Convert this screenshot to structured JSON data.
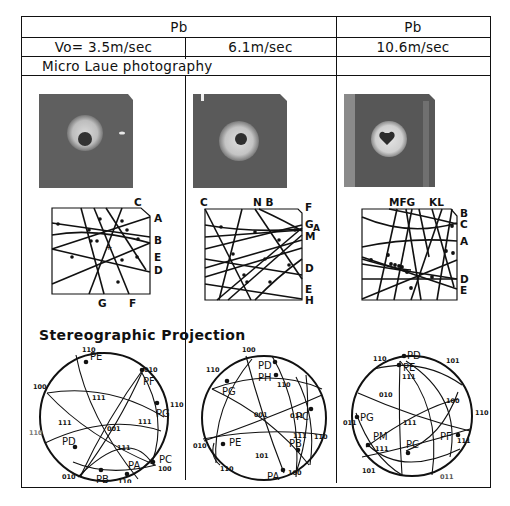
{
  "header": {
    "row1": {
      "left_group": "Pb",
      "right_group": "Pb"
    },
    "row2": {
      "col1": "Vo= 3.5m/sec",
      "col2": "6.1m/sec",
      "col3": "10.6m/sec"
    },
    "row3": {
      "label": "Micro Laue photography"
    }
  },
  "sections": {
    "stereo_title": "Stereographic Projection"
  },
  "laue_traces": [
    {
      "top_labels": "C",
      "right_labels": [
        "A",
        "B",
        "E",
        "D"
      ],
      "bottom_labels": [
        "G",
        "F"
      ]
    },
    {
      "top_labels": [
        "C",
        "N B",
        "F"
      ],
      "right_labels": [
        "G",
        "A",
        "M",
        "D",
        "E",
        "H"
      ]
    },
    {
      "top_labels": [
        "MFG",
        "KL"
      ],
      "right_labels": [
        "B",
        "C",
        "A",
        "D",
        "E"
      ]
    }
  ],
  "stereograms": [
    {
      "poles": [
        "PE",
        "PF",
        "PG",
        "PC",
        "PA",
        "PB",
        "PD"
      ],
      "indices": [
        "110",
        "010",
        "100",
        "110",
        "111",
        "111",
        "001",
        "111",
        "111",
        "110",
        "100",
        "010",
        "110"
      ]
    },
    {
      "poles": [
        "PD",
        "PH",
        "PG",
        "PC",
        "PE",
        "PB",
        "PA"
      ],
      "indices": [
        "100",
        "110",
        "110",
        "001",
        "011",
        "010",
        "111",
        "110",
        "101",
        "110",
        "100"
      ]
    },
    {
      "poles": [
        "PD",
        "PE",
        "PG",
        "PM",
        "PC",
        "PF"
      ],
      "indices": [
        "110",
        "101",
        "111",
        "010",
        "100",
        "011",
        "111",
        "110",
        "111",
        "111",
        "101",
        "011"
      ]
    }
  ]
}
